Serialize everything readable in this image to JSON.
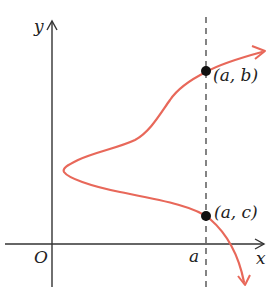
{
  "diagram": {
    "type": "function-graph",
    "axes": {
      "x_label": "x",
      "y_label": "y",
      "origin_label": "O"
    },
    "vertical_line": {
      "label": "a",
      "style": "dashed"
    },
    "points": [
      {
        "label": "(a, b)"
      },
      {
        "label": "(a, c)"
      }
    ],
    "colors": {
      "curve": "#e8685a",
      "axes": "#333333",
      "points": "#111111",
      "dashed_line": "#333333"
    }
  }
}
